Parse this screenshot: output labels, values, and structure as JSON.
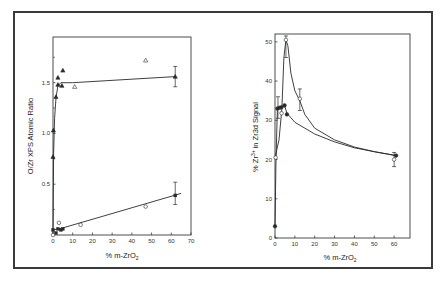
{
  "chart_data": [
    {
      "type": "scatter",
      "panel": "left",
      "title": "",
      "xlabel": "% m-ZrO2",
      "ylabel": "O/Zr XPS Atomic Ratio",
      "xlim": [
        0,
        70
      ],
      "ylim": [
        0,
        1.95
      ],
      "xticks": [
        0,
        10,
        20,
        30,
        40,
        50,
        60,
        70
      ],
      "yticks": [
        0.5,
        1.0,
        1.5
      ],
      "yticks_minor": [
        0.25,
        0.75,
        1.25,
        1.75
      ],
      "grid": false,
      "series": [
        {
          "name": "filled triangles",
          "marker": "triangle-filled",
          "points": [
            [
              0,
              0.77
            ],
            [
              0.2,
              1.03
            ],
            [
              1.5,
              1.36
            ],
            [
              2.5,
              1.55
            ],
            [
              2.5,
              1.48
            ],
            [
              4.5,
              1.47
            ],
            [
              5,
              1.62
            ],
            [
              62,
              1.56
            ]
          ],
          "errorbars": [
            [
              62,
              1.46,
              1.66
            ]
          ],
          "fit_curve": [
            [
              0,
              0.0
            ],
            [
              0.3,
              0.8
            ],
            [
              0.8,
              1.15
            ],
            [
              1.5,
              1.35
            ],
            [
              2.5,
              1.47
            ],
            [
              4,
              1.5
            ],
            [
              10,
              1.5
            ],
            [
              62,
              1.56
            ]
          ]
        },
        {
          "name": "open triangles",
          "marker": "triangle-open",
          "points": [
            [
              11,
              1.46
            ],
            [
              47,
              1.72
            ]
          ]
        },
        {
          "name": "filled squares/circles",
          "marker": "square-filled",
          "points": [
            [
              0,
              0.05
            ],
            [
              1.5,
              0.02
            ],
            [
              2.5,
              0.06
            ],
            [
              4,
              0.05
            ],
            [
              5,
              0.06
            ],
            [
              62,
              0.39
            ]
          ],
          "errorbars": [
            [
              62,
              0.3,
              0.52
            ]
          ],
          "fit_curve": [
            [
              0,
              0.05
            ],
            [
              5,
              0.07
            ],
            [
              65,
              0.41
            ]
          ]
        },
        {
          "name": "open circles",
          "marker": "circle-open",
          "points": [
            [
              0,
              0.0
            ],
            [
              3,
              0.12
            ],
            [
              14,
              0.1
            ],
            [
              47,
              0.28
            ]
          ]
        }
      ]
    },
    {
      "type": "scatter",
      "panel": "right",
      "title": "",
      "xlabel": "% m-ZrO2",
      "ylabel": "% Zr3+ in Zr3d Signal",
      "xlim": [
        0,
        68
      ],
      "ylim": [
        0,
        52
      ],
      "xticks": [
        0,
        10,
        20,
        30,
        40,
        50,
        60
      ],
      "yticks": [
        0,
        10,
        20,
        30,
        40,
        50
      ],
      "grid": false,
      "series": [
        {
          "name": "filled circles",
          "marker": "circle-filled",
          "points": [
            [
              0,
              3
            ],
            [
              1.2,
              33
            ],
            [
              2.2,
              33.2
            ],
            [
              3.2,
              33.3
            ],
            [
              4.8,
              33.8
            ],
            [
              6,
              31.5
            ],
            [
              61,
              21
            ]
          ],
          "fit_curve": [
            [
              0,
              3
            ],
            [
              0.5,
              20
            ],
            [
              1.2,
              33
            ],
            [
              3,
              33.3
            ],
            [
              4.8,
              33.8
            ],
            [
              6,
              31.8
            ],
            [
              10,
              29.5
            ],
            [
              20,
              26.5
            ],
            [
              30,
              24.5
            ],
            [
              40,
              23
            ],
            [
              50,
              22
            ],
            [
              61,
              21
            ]
          ]
        },
        {
          "name": "open circles",
          "marker": "circle-open",
          "points": [
            [
              0.3,
              20.5
            ],
            [
              3.3,
              31.8
            ],
            [
              5.5,
              50.5
            ],
            [
              12.5,
              35.5
            ],
            [
              60,
              20
            ]
          ],
          "errorbars": [
            [
              1.5,
              30.5,
              36
            ],
            [
              5.5,
              46,
              51.5
            ],
            [
              12.5,
              32.5,
              38
            ],
            [
              60,
              18.2,
              21.8
            ]
          ],
          "fit_curve": [
            [
              0,
              20.5
            ],
            [
              2,
              25
            ],
            [
              3.5,
              33
            ],
            [
              4.5,
              46
            ],
            [
              5.5,
              50.5
            ],
            [
              6.5,
              49
            ],
            [
              8,
              42
            ],
            [
              10,
              37.5
            ],
            [
              12.5,
              35
            ],
            [
              15,
              31.5
            ],
            [
              20,
              28
            ],
            [
              30,
              25
            ],
            [
              40,
              23.2
            ],
            [
              50,
              22
            ],
            [
              61,
              21
            ]
          ]
        }
      ]
    }
  ],
  "figure": {
    "left_panel": {
      "ylabel": "O/Zr XPS Atomic Ratio",
      "xlabel_main": "% m-ZrO",
      "xlabel_sub": "2",
      "ytick_labels": [
        "0.5",
        "1.0",
        "1.5"
      ],
      "xtick_labels": [
        "0",
        "10",
        "20",
        "30",
        "40",
        "50",
        "60",
        "70"
      ]
    },
    "right_panel": {
      "ylabel_main": "% Zr",
      "ylabel_sup": "3+",
      "ylabel_rest": " in Zr3d Signal",
      "xlabel_main": "% m-ZrO",
      "xlabel_sub": "2",
      "ytick_labels": [
        "0",
        "10",
        "20",
        "30",
        "40",
        "50"
      ],
      "xtick_labels": [
        "0",
        "10",
        "20",
        "30",
        "40",
        "50",
        "60"
      ]
    },
    "colors": {
      "ink": "#2a2a2a",
      "frame": "#3a3a3a",
      "background": "#ffffff"
    }
  }
}
